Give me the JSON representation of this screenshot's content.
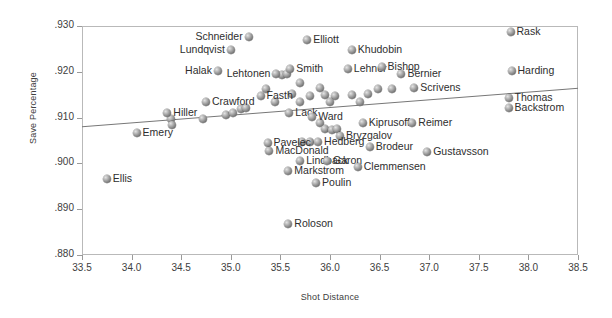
{
  "chart_data": {
    "type": "scatter",
    "title": "",
    "xlabel": "Shot Distance",
    "ylabel": "Save Percentage",
    "xlim": [
      33.5,
      38.5
    ],
    "ylim": [
      0.88,
      0.93
    ],
    "xticks": [
      "33.5",
      "34.0",
      "34.5",
      "35.0",
      "35.5",
      "36.0",
      "36.5",
      "37.0",
      "37.5",
      "38.0",
      "38.5"
    ],
    "yticks": [
      ".930",
      ".920",
      ".910",
      ".900",
      ".890",
      ".880"
    ],
    "grid": false,
    "legend": "none",
    "trendline": {
      "x0": 33.5,
      "y0": 0.908,
      "x1": 38.5,
      "y1": 0.9164
    },
    "points": [
      {
        "label": "Schneider",
        "x": 35.18,
        "y": 0.9275,
        "side": "left"
      },
      {
        "label": "Lundqvist",
        "x": 35.0,
        "y": 0.9248,
        "side": "left"
      },
      {
        "label": "Elliott",
        "x": 35.77,
        "y": 0.927,
        "side": "right"
      },
      {
        "label": "Khudobin",
        "x": 36.22,
        "y": 0.9248,
        "side": "right"
      },
      {
        "label": "Rask",
        "x": 37.82,
        "y": 0.9287,
        "side": "right"
      },
      {
        "label": "Halak",
        "x": 34.87,
        "y": 0.9202,
        "side": "left"
      },
      {
        "label": "Lehtonen",
        "x": 35.46,
        "y": 0.9196,
        "side": "left"
      },
      {
        "label": "Smith",
        "x": 35.6,
        "y": 0.9206,
        "side": "right"
      },
      {
        "label": "Lehner",
        "x": 36.18,
        "y": 0.9206,
        "side": "right"
      },
      {
        "label": "Bishop",
        "x": 36.52,
        "y": 0.9211,
        "side": "right"
      },
      {
        "label": "Bernier",
        "x": 36.72,
        "y": 0.9196,
        "side": "right"
      },
      {
        "label": "Harding",
        "x": 37.83,
        "y": 0.9202,
        "side": "right"
      },
      {
        "label": "Scrivens",
        "x": 36.85,
        "y": 0.9165,
        "side": "right"
      },
      {
        "label": "Fasth",
        "x": 35.3,
        "y": 0.9148,
        "side": "right"
      },
      {
        "label": "Thomas",
        "x": 37.8,
        "y": 0.9143,
        "side": "right"
      },
      {
        "label": "Crawford",
        "x": 34.75,
        "y": 0.9133,
        "side": "right"
      },
      {
        "label": "Lack",
        "x": 35.59,
        "y": 0.911,
        "side": "right"
      },
      {
        "label": "Ward",
        "x": 35.82,
        "y": 0.9102,
        "side": "right"
      },
      {
        "label": "Backstrom",
        "x": 37.8,
        "y": 0.9122,
        "side": "right"
      },
      {
        "label": "Hiller",
        "x": 34.36,
        "y": 0.911,
        "side": "right"
      },
      {
        "label": "Kiprusoff",
        "x": 36.33,
        "y": 0.9088,
        "side": "right"
      },
      {
        "label": "Reimer",
        "x": 36.83,
        "y": 0.9088,
        "side": "right"
      },
      {
        "label": "Emery",
        "x": 34.05,
        "y": 0.9066,
        "side": "right"
      },
      {
        "label": "Bryzgalov",
        "x": 36.1,
        "y": 0.906,
        "side": "right"
      },
      {
        "label": "Hedberg",
        "x": 35.88,
        "y": 0.9046,
        "side": "right"
      },
      {
        "label": "Pavelec",
        "x": 35.37,
        "y": 0.9044,
        "side": "right"
      },
      {
        "label": "MacDonald",
        "x": 35.39,
        "y": 0.9028,
        "side": "right"
      },
      {
        "label": "Brodeur",
        "x": 36.4,
        "y": 0.9035,
        "side": "right"
      },
      {
        "label": "Gustavsson",
        "x": 36.98,
        "y": 0.9024,
        "side": "right"
      },
      {
        "label": "Lindback",
        "x": 35.7,
        "y": 0.9005,
        "side": "right"
      },
      {
        "label": "Garon",
        "x": 35.97,
        "y": 0.9005,
        "side": "right"
      },
      {
        "label": "Clemmensen",
        "x": 36.28,
        "y": 0.8992,
        "side": "right"
      },
      {
        "label": "Markstrom",
        "x": 35.58,
        "y": 0.8983,
        "side": "right"
      },
      {
        "label": "Ellis",
        "x": 33.75,
        "y": 0.8965,
        "side": "right"
      },
      {
        "label": "Poulin",
        "x": 35.86,
        "y": 0.8958,
        "side": "right"
      },
      {
        "label": "Roloson",
        "x": 35.58,
        "y": 0.8867,
        "side": "right"
      }
    ],
    "unlabeled_points": [
      {
        "x": 35.52,
        "y": 0.9192
      },
      {
        "x": 35.57,
        "y": 0.9196
      },
      {
        "x": 35.7,
        "y": 0.9175
      },
      {
        "x": 35.9,
        "y": 0.9165
      },
      {
        "x": 35.35,
        "y": 0.9163
      },
      {
        "x": 35.62,
        "y": 0.9152
      },
      {
        "x": 35.8,
        "y": 0.9148
      },
      {
        "x": 35.95,
        "y": 0.915
      },
      {
        "x": 36.05,
        "y": 0.9148
      },
      {
        "x": 36.22,
        "y": 0.915
      },
      {
        "x": 36.38,
        "y": 0.9152
      },
      {
        "x": 36.48,
        "y": 0.9163
      },
      {
        "x": 36.62,
        "y": 0.9163
      },
      {
        "x": 35.45,
        "y": 0.9133
      },
      {
        "x": 35.7,
        "y": 0.9135
      },
      {
        "x": 36.0,
        "y": 0.9133
      },
      {
        "x": 36.3,
        "y": 0.9133
      },
      {
        "x": 34.4,
        "y": 0.9098
      },
      {
        "x": 34.41,
        "y": 0.9083
      },
      {
        "x": 34.72,
        "y": 0.9098
      },
      {
        "x": 34.95,
        "y": 0.9105
      },
      {
        "x": 35.02,
        "y": 0.911
      },
      {
        "x": 35.1,
        "y": 0.9118
      },
      {
        "x": 35.15,
        "y": 0.9122
      },
      {
        "x": 35.9,
        "y": 0.9088
      },
      {
        "x": 35.95,
        "y": 0.9075
      },
      {
        "x": 36.02,
        "y": 0.9072
      },
      {
        "x": 36.07,
        "y": 0.9075
      },
      {
        "x": 35.72,
        "y": 0.9046
      },
      {
        "x": 35.8,
        "y": 0.9046
      }
    ]
  }
}
